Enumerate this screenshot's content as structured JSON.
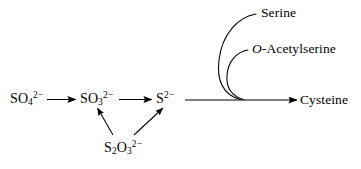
{
  "diagram": {
    "background_color": "#ffffff",
    "stroke_color": "#000000",
    "nodes": [
      {
        "id": "sulfate",
        "name": "sulfate",
        "base": "SO",
        "subscript": "4",
        "superscript": "2−",
        "x": 10,
        "y": 94
      },
      {
        "id": "sulfite",
        "name": "sulfite",
        "base": "SO",
        "subscript": "3",
        "superscript": "2−",
        "x": 80,
        "y": 94
      },
      {
        "id": "sulfide",
        "name": "sulfide",
        "base": "S",
        "subscript": "",
        "superscript": "2−",
        "x": 156,
        "y": 94
      },
      {
        "id": "thiosulfate",
        "name": "thiosulfate",
        "base": "S",
        "subscript": "2",
        "base2": "O",
        "subscript2": "3",
        "superscript": "2−",
        "x": 104,
        "y": 143
      }
    ],
    "cofactors": [
      {
        "id": "serine",
        "label": "Serine",
        "x": 261,
        "y": 11
      },
      {
        "id": "o-acetylserine",
        "italic_part": "O",
        "label": "-Acetylserine",
        "x": 252,
        "y": 47
      }
    ],
    "product": {
      "id": "cysteine",
      "label": "Cysteine",
      "x": 300,
      "y": 94
    },
    "arrows": [
      {
        "id": "sulfate-to-sulfite",
        "from": "sulfate",
        "to": "sulfite",
        "kind": "straight"
      },
      {
        "id": "sulfite-to-sulfide",
        "from": "sulfite",
        "to": "sulfide",
        "kind": "straight"
      },
      {
        "id": "thiosulfate-to-sulfite",
        "from": "thiosulfate",
        "to": "sulfite",
        "kind": "diagonal"
      },
      {
        "id": "thiosulfate-to-sulfide",
        "from": "thiosulfate",
        "to": "sulfide",
        "kind": "diagonal"
      },
      {
        "id": "sulfide-to-cysteine",
        "from": "sulfide",
        "to": "cysteine",
        "kind": "straight-long"
      },
      {
        "id": "serine-inflow",
        "from": "serine",
        "to": "sulfide-to-cysteine",
        "kind": "curved"
      },
      {
        "id": "o-acetylserine-inflow",
        "from": "o-acetylserine",
        "to": "sulfide-to-cysteine",
        "kind": "curved"
      }
    ]
  }
}
